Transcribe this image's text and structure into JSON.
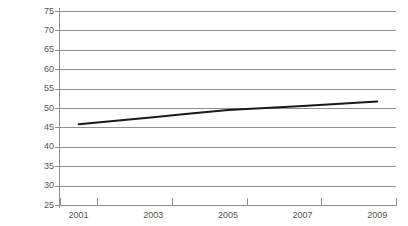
{
  "chart_data": {
    "type": "line",
    "title": "",
    "subtitle": "",
    "xlabel": "",
    "ylabel": "",
    "x": [
      2001,
      2002,
      2003,
      2004,
      2005,
      2006,
      2007,
      2008,
      2009
    ],
    "series": [
      {
        "name": "",
        "values": [
          45.8,
          46.7,
          47.6,
          48.6,
          49.5,
          50.0,
          50.5,
          51.1,
          51.7
        ],
        "color": "#1a1a1a",
        "line_width": 2
      }
    ],
    "categories": [
      "2001",
      "2002",
      "2003",
      "2004",
      "2005",
      "2006",
      "2007",
      "2008",
      "2009"
    ],
    "xlim": [
      2000.5,
      2009.5
    ],
    "ylim": [
      25,
      75
    ],
    "y_ticks": [
      25,
      30,
      35,
      40,
      45,
      50,
      55,
      60,
      65,
      70,
      75
    ],
    "y_tick_labels": [
      "25",
      "30",
      "35",
      "40",
      "45",
      "50",
      "55",
      "60",
      "65",
      "70",
      "75"
    ],
    "x_ticks": [
      2001,
      2003,
      2005,
      2007,
      2009
    ],
    "x_tick_labels": [
      "2001",
      "2003",
      "2005",
      "2007",
      "2009"
    ],
    "x_minor_ticks": [
      2002,
      2004,
      2006,
      2008
    ],
    "grid": "horizontal",
    "grid_color": "#8f8f8f",
    "legend": "none",
    "legend_position": "none",
    "background": "#ffffff",
    "annotations": []
  }
}
